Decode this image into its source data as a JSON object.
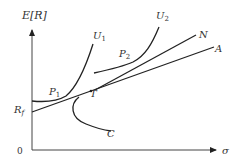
{
  "diagram": {
    "axes": {
      "y_label": "E[R]",
      "x_label": "σ",
      "origin_label": "0"
    },
    "labels": {
      "u1": "U",
      "u1_sub": "1",
      "u2": "U",
      "u2_sub": "2",
      "n": "N",
      "a": "A",
      "p1": "P",
      "p1_sub": "1",
      "p2": "P",
      "p2_sub": "2",
      "t": "T",
      "c": "C",
      "rf": "R",
      "rf_sub": "f"
    },
    "colors": {
      "line": "#222222",
      "text": "#333333",
      "background": "#ffffff"
    }
  }
}
